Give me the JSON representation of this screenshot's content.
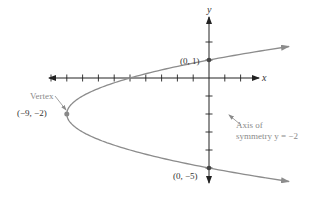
{
  "diagram": {
    "type": "parabola-graph",
    "equation_form": "x = (y + 2)^2 - 9",
    "axes": {
      "x_label": "x",
      "y_label": "y",
      "x_ticks": [
        -10,
        -9,
        -8,
        -7,
        -6,
        -5,
        -4,
        -3,
        -2,
        -1,
        1,
        2
      ],
      "y_ticks": [
        2,
        1,
        -1,
        -2,
        -3,
        -4,
        -5
      ]
    },
    "points": {
      "y_intercept_top": {
        "label": "(0, 1)",
        "x": 0,
        "y": 1
      },
      "vertex": {
        "label": "(−9, −2)",
        "x": -9,
        "y": -2
      },
      "y_intercept_bottom": {
        "label": "(0, −5)",
        "x": 0,
        "y": -5
      }
    },
    "annotations": {
      "vertex_label": "Vertex",
      "axis_of_symmetry_line1": "Axis of",
      "axis_of_symmetry_line2": "symmetry y = −2"
    },
    "colors": {
      "axes": "#222222",
      "curve": "#8c8c8c",
      "points": "#444444",
      "annotation": "#8a8a8a"
    }
  }
}
